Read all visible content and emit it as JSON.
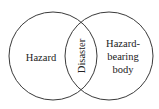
{
  "diagram": {
    "type": "venn",
    "sets": [
      {
        "id": "left",
        "label": "Hazard"
      },
      {
        "id": "right",
        "label_lines": [
          "Hazard-",
          "bearing",
          "body"
        ]
      }
    ],
    "intersection": {
      "label": "Disaster",
      "orientation": "vertical-bottom-to-top"
    },
    "colors": {
      "stroke": "#3a3a3a",
      "text": "#222222",
      "background": "#ffffff"
    }
  }
}
